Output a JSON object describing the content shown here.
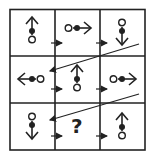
{
  "puzzle": {
    "type": "3x3 matrix reasoning",
    "missing_label": "?",
    "grid": {
      "rows": 3,
      "cols": 3
    },
    "cells": [
      {
        "row": 0,
        "col": 0,
        "glyph": "arrow",
        "direction": "up"
      },
      {
        "row": 0,
        "col": 1,
        "glyph": "arrow",
        "direction": "right"
      },
      {
        "row": 0,
        "col": 2,
        "glyph": "arrow",
        "direction": "down"
      },
      {
        "row": 1,
        "col": 0,
        "glyph": "arrow",
        "direction": "left"
      },
      {
        "row": 1,
        "col": 1,
        "glyph": "arrow",
        "direction": "up"
      },
      {
        "row": 1,
        "col": 2,
        "glyph": "arrow",
        "direction": "right"
      },
      {
        "row": 2,
        "col": 0,
        "glyph": "arrow",
        "direction": "down"
      },
      {
        "row": 2,
        "col": 1,
        "glyph": "question",
        "direction": ""
      },
      {
        "row": 2,
        "col": 2,
        "glyph": "arrow",
        "direction": "up"
      }
    ],
    "flow": "left-to-right small arrows between cells, diagonal arrows wrap from end of row to start of next row",
    "colors": {
      "line": "#222222",
      "background": "#ffffff"
    }
  }
}
